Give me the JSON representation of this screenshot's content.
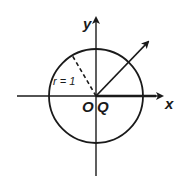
{
  "diagram": {
    "type": "unit-circle",
    "colors": {
      "stroke": "#1a1a1a",
      "background": "#ffffff"
    },
    "labels": {
      "x_axis": "x",
      "y_axis": "y",
      "origin": "O",
      "point": "Q",
      "radius": "r = 1"
    },
    "geometry": {
      "center": [
        96,
        96
      ],
      "radius": 47,
      "ray_end": [
        148,
        42
      ],
      "dashed_radius_end": [
        72,
        54
      ]
    }
  }
}
